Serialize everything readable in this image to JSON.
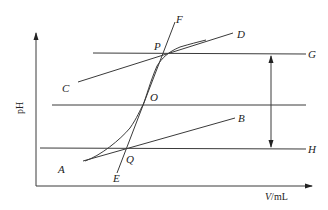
{
  "diagram": {
    "type": "titration-curve-three-tangent-method",
    "axes": {
      "ylabel": "pH",
      "xlabel_var": "V",
      "xlabel_unit": "/mL"
    },
    "points": {
      "A": "A",
      "B": "B",
      "C": "C",
      "D": "D",
      "E": "E",
      "F": "F",
      "G": "G",
      "H": "H",
      "O": "O",
      "P": "P",
      "Q": "Q"
    },
    "lines": [
      {
        "name": "CD",
        "desc": "upper tangent line"
      },
      {
        "name": "AB",
        "desc": "lower tangent line"
      },
      {
        "name": "EF",
        "desc": "steepest tangent through inflection"
      },
      {
        "name": "PG",
        "desc": "horizontal through P"
      },
      {
        "name": "QH",
        "desc": "horizontal through Q"
      },
      {
        "name": "O-mid",
        "desc": "horizontal midline through O"
      }
    ],
    "colors": {
      "stroke": "#3a3a3a",
      "text": "#222222",
      "background": "#ffffff"
    }
  }
}
